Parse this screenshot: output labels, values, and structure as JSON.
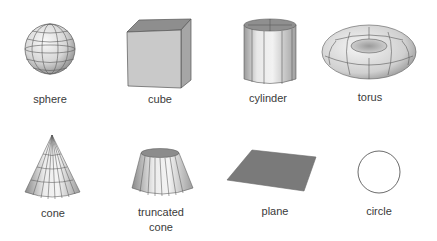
{
  "shapes": [
    {
      "id": "sphere",
      "label": "sphere"
    },
    {
      "id": "cube",
      "label": "cube"
    },
    {
      "id": "cylinder",
      "label": "cylinder"
    },
    {
      "id": "torus",
      "label": "torus"
    },
    {
      "id": "cone",
      "label": "cone"
    },
    {
      "id": "truncated-cone",
      "label_line1": "truncated",
      "label_line2": "cone"
    },
    {
      "id": "plane",
      "label": "plane"
    },
    {
      "id": "circle",
      "label": "circle"
    }
  ],
  "colors": {
    "background": "#ffffff",
    "edge": "#555555",
    "surface_light": "#f2f2f2",
    "surface_mid": "#c8c8c8",
    "surface_dark": "#8a8a8a",
    "plane_fill": "#7a7a7a",
    "label_text": "#3a3a3a"
  }
}
